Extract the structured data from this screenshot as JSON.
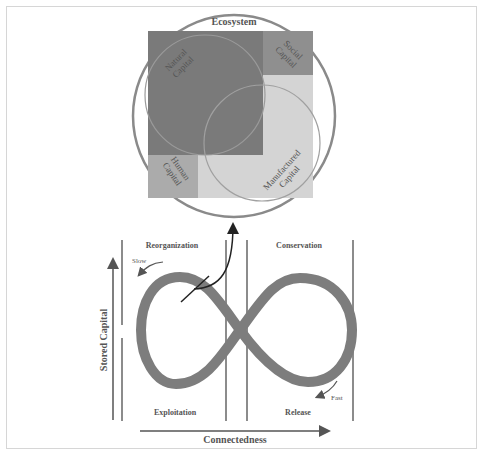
{
  "top_figure": {
    "outer_label": "Ecosystem",
    "regions": [
      {
        "id": "natural",
        "line1": "Natural",
        "line2": "Capital",
        "color": "#7a7a7a"
      },
      {
        "id": "social",
        "line1": "Social",
        "line2": "Capital",
        "color": "#8e8e8e"
      },
      {
        "id": "human",
        "line1": "Human",
        "line2": "Capital",
        "color": "#a9a9a9"
      },
      {
        "id": "manufactured",
        "line1": "Manufactured",
        "line2": "Capital",
        "color": "#d4d4d4"
      }
    ],
    "circle_color": "#888888"
  },
  "cycle_figure": {
    "phases": {
      "top_left": "Reorganization",
      "top_right": "Conservation",
      "bottom_left": "Exploitation",
      "bottom_right": "Release"
    },
    "speed_labels": {
      "slow": "Slow",
      "fast": "Fast"
    },
    "y_axis_label": "Stored Capital",
    "x_axis_label": "Connectedness",
    "band_color": "#7d7d7d",
    "line_color": "#666666"
  }
}
